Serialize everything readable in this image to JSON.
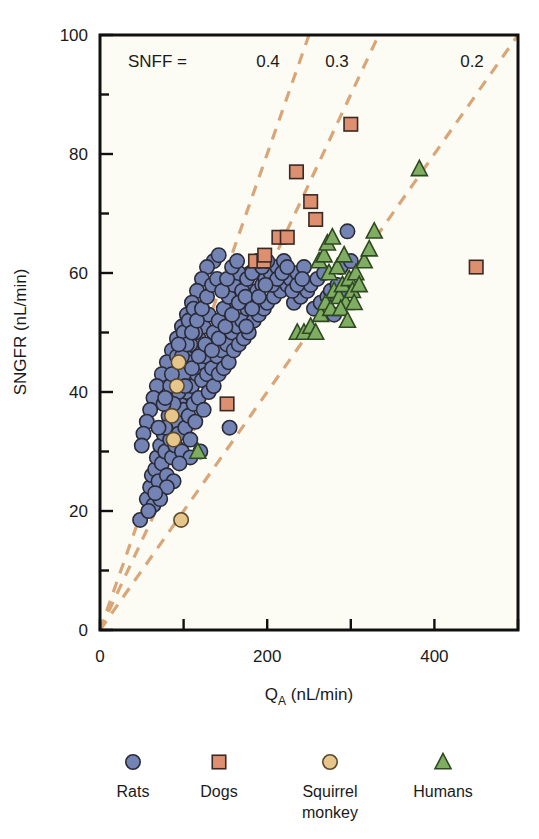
{
  "chart_data": {
    "type": "scatter",
    "title": "",
    "xlabel": "Q_A (nL/min)",
    "xlabel_main": "Q",
    "xlabel_sub": "A",
    "xlabel_units": " (nL/min)",
    "ylabel": "SNGFR (nL/min)",
    "xlim": [
      0,
      500
    ],
    "ylim": [
      0,
      100
    ],
    "xticks": [
      0,
      100,
      200,
      300,
      400,
      500
    ],
    "xtick_labels": [
      "0",
      "",
      "200",
      "",
      "400",
      ""
    ],
    "yticks": [
      0,
      10,
      20,
      30,
      40,
      50,
      60,
      70,
      80,
      90,
      100
    ],
    "ytick_labels": [
      "0",
      "",
      "20",
      "",
      "40",
      "",
      "60",
      "",
      "80",
      "",
      "100"
    ],
    "grid": false,
    "legend_position": "below-plot",
    "annotation_prefix": "SNFF =",
    "reference_lines": [
      {
        "label": "0.4",
        "slope": 0.4,
        "label_x": 268,
        "style": "dashed",
        "color": "#d9a679"
      },
      {
        "label": "0.3",
        "slope": 0.3,
        "label_x": 337,
        "style": "dashed",
        "color": "#d9a679"
      },
      {
        "label": "0.2",
        "slope": 0.2,
        "label_x": 472,
        "style": "dashed",
        "color": "#d9a679"
      }
    ],
    "series": [
      {
        "name": "Rats",
        "marker": "circle",
        "color": "#7383b4",
        "edge": "#2b2b38",
        "points": [
          [
            48,
            18.5
          ],
          [
            56,
            22
          ],
          [
            60,
            24
          ],
          [
            62,
            26
          ],
          [
            64,
            21
          ],
          [
            66,
            27
          ],
          [
            68,
            29
          ],
          [
            70,
            25
          ],
          [
            72,
            31
          ],
          [
            74,
            28
          ],
          [
            76,
            33
          ],
          [
            78,
            30
          ],
          [
            80,
            26
          ],
          [
            82,
            34
          ],
          [
            84,
            32
          ],
          [
            86,
            29
          ],
          [
            88,
            36
          ],
          [
            90,
            31
          ],
          [
            92,
            35
          ],
          [
            94,
            33
          ],
          [
            96,
            38
          ],
          [
            98,
            30
          ],
          [
            100,
            37
          ],
          [
            102,
            34
          ],
          [
            104,
            40
          ],
          [
            106,
            36
          ],
          [
            108,
            32
          ],
          [
            110,
            41
          ],
          [
            112,
            38
          ],
          [
            114,
            35
          ],
          [
            116,
            43
          ],
          [
            118,
            39
          ],
          [
            120,
            45
          ],
          [
            122,
            42
          ],
          [
            124,
            37
          ],
          [
            126,
            46
          ],
          [
            128,
            43
          ],
          [
            130,
            40
          ],
          [
            132,
            48
          ],
          [
            134,
            44
          ],
          [
            136,
            41
          ],
          [
            138,
            49
          ],
          [
            140,
            46
          ],
          [
            142,
            43
          ],
          [
            144,
            50
          ],
          [
            146,
            47
          ],
          [
            148,
            44
          ],
          [
            150,
            52
          ],
          [
            152,
            48
          ],
          [
            154,
            45
          ],
          [
            156,
            53
          ],
          [
            158,
            50
          ],
          [
            160,
            47
          ],
          [
            162,
            55
          ],
          [
            164,
            51
          ],
          [
            166,
            48
          ],
          [
            168,
            56
          ],
          [
            170,
            52
          ],
          [
            172,
            49
          ],
          [
            174,
            58
          ],
          [
            176,
            54
          ],
          [
            178,
            50
          ],
          [
            180,
            60
          ],
          [
            182,
            56
          ],
          [
            184,
            52
          ],
          [
            186,
            61
          ],
          [
            188,
            57
          ],
          [
            190,
            53
          ],
          [
            192,
            62
          ],
          [
            194,
            58
          ],
          [
            196,
            54
          ],
          [
            198,
            59
          ],
          [
            200,
            55
          ],
          [
            204,
            60
          ],
          [
            208,
            56
          ],
          [
            212,
            61
          ],
          [
            216,
            57
          ],
          [
            220,
            62
          ],
          [
            224,
            58
          ],
          [
            228,
            59
          ],
          [
            232,
            55
          ],
          [
            236,
            60
          ],
          [
            240,
            56
          ],
          [
            244,
            61
          ],
          [
            248,
            57
          ],
          [
            252,
            58
          ],
          [
            256,
            54
          ],
          [
            260,
            59
          ],
          [
            264,
            55
          ],
          [
            268,
            60
          ],
          [
            272,
            56
          ],
          [
            276,
            57
          ],
          [
            280,
            53
          ],
          [
            284,
            58
          ],
          [
            288,
            61
          ],
          [
            292,
            57
          ],
          [
            296,
            67
          ],
          [
            300,
            62
          ],
          [
            155,
            34
          ],
          [
            175,
            51
          ],
          [
            120,
            30
          ],
          [
            108,
            29
          ],
          [
            95,
            28
          ],
          [
            88,
            25
          ],
          [
            80,
            24
          ],
          [
            72,
            22
          ],
          [
            66,
            23
          ],
          [
            58,
            20
          ],
          [
            112,
            47
          ],
          [
            118,
            49
          ],
          [
            124,
            51
          ],
          [
            130,
            53
          ],
          [
            136,
            50
          ],
          [
            142,
            52
          ],
          [
            148,
            54
          ],
          [
            154,
            56
          ],
          [
            160,
            58
          ],
          [
            166,
            60
          ],
          [
            136,
            62
          ],
          [
            142,
            63
          ],
          [
            128,
            61
          ],
          [
            122,
            59
          ],
          [
            116,
            57
          ],
          [
            110,
            55
          ],
          [
            104,
            53
          ],
          [
            98,
            51
          ],
          [
            92,
            49
          ],
          [
            86,
            47
          ],
          [
            80,
            45
          ],
          [
            74,
            43
          ],
          [
            68,
            41
          ],
          [
            64,
            39
          ],
          [
            60,
            37
          ],
          [
            56,
            35
          ],
          [
            52,
            33
          ],
          [
            50,
            31
          ],
          [
            90,
            42
          ],
          [
            96,
            44
          ],
          [
            102,
            46
          ],
          [
            108,
            48
          ],
          [
            114,
            50
          ],
          [
            100,
            43
          ],
          [
            106,
            45
          ],
          [
            94,
            40
          ],
          [
            88,
            38
          ],
          [
            82,
            36
          ],
          [
            78,
            34
          ],
          [
            76,
            38
          ],
          [
            84,
            41
          ],
          [
            92,
            46
          ],
          [
            100,
            50
          ],
          [
            106,
            52
          ],
          [
            112,
            54
          ],
          [
            98,
            46
          ],
          [
            104,
            48
          ],
          [
            110,
            50
          ],
          [
            116,
            52
          ],
          [
            122,
            54
          ],
          [
            128,
            56
          ],
          [
            134,
            58
          ],
          [
            140,
            59
          ],
          [
            146,
            57
          ],
          [
            152,
            59
          ],
          [
            158,
            61
          ],
          [
            164,
            62
          ],
          [
            170,
            57
          ],
          [
            176,
            59
          ],
          [
            182,
            60
          ],
          [
            188,
            62
          ],
          [
            194,
            61
          ],
          [
            200,
            62
          ],
          [
            206,
            58
          ],
          [
            212,
            59
          ],
          [
            218,
            60
          ],
          [
            224,
            61
          ],
          [
            230,
            57
          ],
          [
            236,
            58
          ],
          [
            242,
            59
          ],
          [
            70,
            34
          ],
          [
            78,
            39
          ],
          [
            86,
            43
          ],
          [
            94,
            48
          ],
          [
            102,
            41
          ],
          [
            110,
            44
          ],
          [
            118,
            46
          ],
          [
            126,
            48
          ],
          [
            134,
            47
          ],
          [
            142,
            49
          ],
          [
            150,
            51
          ],
          [
            158,
            53
          ],
          [
            166,
            55
          ],
          [
            174,
            56
          ],
          [
            182,
            54
          ],
          [
            190,
            56
          ],
          [
            198,
            58
          ]
        ]
      },
      {
        "name": "Dogs",
        "marker": "square",
        "color": "#dd8f70",
        "edge": "#3a2a24",
        "points": [
          [
            152,
            38
          ],
          [
            186,
            62
          ],
          [
            196,
            62
          ],
          [
            214,
            66
          ],
          [
            224,
            66
          ],
          [
            235,
            77
          ],
          [
            252,
            72
          ],
          [
            258,
            69
          ],
          [
            300,
            85
          ],
          [
            450,
            61
          ],
          [
            197,
            63
          ]
        ]
      },
      {
        "name": "Squirrel monkey",
        "marker": "circle",
        "color": "#e6c68a",
        "edge": "#5a4a2a",
        "points": [
          [
            97,
            18.5
          ],
          [
            88,
            32
          ],
          [
            86,
            36
          ],
          [
            94,
            45
          ],
          [
            92,
            41
          ]
        ]
      },
      {
        "name": "Humans",
        "marker": "triangle",
        "color": "#7fae63",
        "edge": "#2f4a22",
        "points": [
          [
            117,
            30
          ],
          [
            236,
            50
          ],
          [
            244,
            50
          ],
          [
            252,
            51
          ],
          [
            258,
            50
          ],
          [
            264,
            53
          ],
          [
            270,
            55
          ],
          [
            276,
            54
          ],
          [
            280,
            57
          ],
          [
            286,
            56
          ],
          [
            290,
            58
          ],
          [
            294,
            55
          ],
          [
            298,
            59
          ],
          [
            302,
            57
          ],
          [
            306,
            60
          ],
          [
            310,
            58
          ],
          [
            316,
            62
          ],
          [
            322,
            64
          ],
          [
            328,
            67
          ],
          [
            262,
            62
          ],
          [
            268,
            63
          ],
          [
            274,
            60
          ],
          [
            284,
            61
          ],
          [
            288,
            54
          ],
          [
            296,
            52
          ],
          [
            304,
            55
          ],
          [
            292,
            63
          ],
          [
            382,
            77.5
          ],
          [
            272,
            65
          ],
          [
            278,
            66
          ]
        ]
      }
    ]
  },
  "legend": {
    "items": [
      {
        "label": "Rats",
        "label2": "",
        "marker": "circle",
        "color": "#7383b4",
        "edge": "#2b2b38"
      },
      {
        "label": "Dogs",
        "label2": "",
        "marker": "square",
        "color": "#dd8f70",
        "edge": "#3a2a24"
      },
      {
        "label": "Squirrel",
        "label2": "monkey",
        "marker": "circle",
        "color": "#e6c68a",
        "edge": "#5a4a2a"
      },
      {
        "label": "Humans",
        "label2": "",
        "marker": "triangle",
        "color": "#7fae63",
        "edge": "#2f4a22"
      }
    ]
  },
  "colors": {
    "background": "#fdfcf4",
    "frame": "#101010",
    "text": "#1a1a1a",
    "reference_line": "#d9a679"
  }
}
